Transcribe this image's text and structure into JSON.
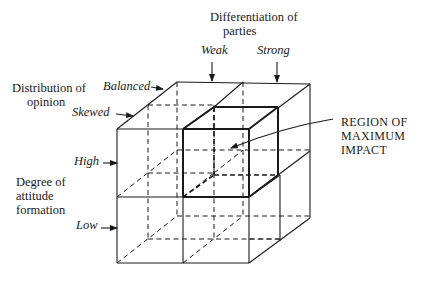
{
  "figure": {
    "type": "3d-cube-matrix",
    "grid": "2x2x2",
    "axes": {
      "horizontal": {
        "title_line1": "Differentiation of",
        "title_line2": "parties",
        "levels": [
          "Weak",
          "Strong"
        ]
      },
      "depth": {
        "title_line1": "Distribution of",
        "title_line2": "opinion",
        "levels": [
          "Balanced",
          "Skewed"
        ]
      },
      "vertical": {
        "title_line1": "Degree of",
        "title_line2": "attitude",
        "title_line3": "formation",
        "levels": [
          "High",
          "Low"
        ]
      }
    },
    "callout": {
      "line1": "REGION OF",
      "line2": "MAXIMUM",
      "line3": "IMPACT",
      "highlighted_cell": {
        "differentiation": "Strong",
        "distribution": "Skewed",
        "attitude": "High"
      }
    }
  },
  "colors": {
    "ink": "#1a1a1a",
    "background": "#ffffff"
  }
}
